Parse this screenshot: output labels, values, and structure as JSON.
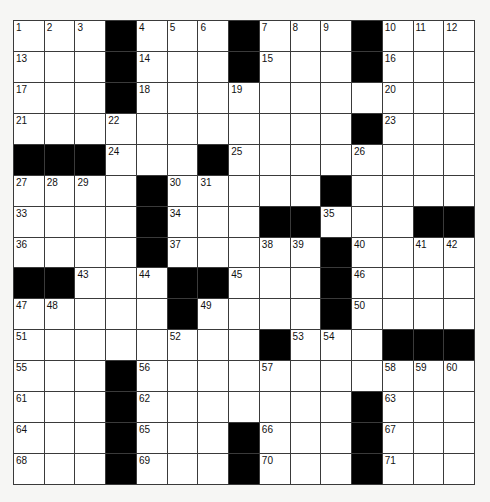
{
  "puzzle": {
    "rows": 15,
    "cols": 15,
    "grid": [
      "...#...#...#...",
      "...#...#...#...",
      "...#...........",
      "...........#...",
      "###...#........",
      "....#.....#....",
      "....#...##...##",
      "....#.....#....",
      "##...##...#....",
      ".....#....#....",
      "........#...###",
      "...#...........",
      "...#.......#...",
      "...#...#...#...",
      "...#...#...#..."
    ],
    "numbers": [
      [
        1,
        2,
        3,
        0,
        4,
        5,
        6,
        0,
        7,
        8,
        9,
        0,
        10,
        11,
        12
      ],
      [
        13,
        0,
        0,
        0,
        14,
        0,
        0,
        0,
        15,
        0,
        0,
        0,
        16,
        0,
        0
      ],
      [
        17,
        0,
        0,
        0,
        18,
        0,
        0,
        19,
        0,
        0,
        0,
        0,
        20,
        0,
        0
      ],
      [
        21,
        0,
        0,
        22,
        0,
        0,
        0,
        0,
        0,
        0,
        0,
        0,
        23,
        0,
        0
      ],
      [
        0,
        0,
        0,
        24,
        0,
        0,
        0,
        25,
        0,
        0,
        0,
        26,
        0,
        0,
        0
      ],
      [
        27,
        28,
        29,
        0,
        0,
        30,
        31,
        0,
        0,
        0,
        32,
        0,
        0,
        0,
        0
      ],
      [
        33,
        0,
        0,
        0,
        0,
        34,
        0,
        0,
        0,
        0,
        35,
        0,
        0,
        0,
        0
      ],
      [
        36,
        0,
        0,
        0,
        0,
        37,
        0,
        0,
        38,
        39,
        0,
        40,
        0,
        41,
        42
      ],
      [
        0,
        0,
        43,
        0,
        44,
        0,
        0,
        45,
        0,
        0,
        0,
        46,
        0,
        0,
        0
      ],
      [
        47,
        48,
        0,
        0,
        0,
        0,
        49,
        0,
        0,
        0,
        0,
        50,
        0,
        0,
        0
      ],
      [
        51,
        0,
        0,
        0,
        0,
        52,
        0,
        0,
        0,
        53,
        54,
        0,
        0,
        0,
        0
      ],
      [
        55,
        0,
        0,
        0,
        56,
        0,
        0,
        0,
        57,
        0,
        0,
        0,
        58,
        59,
        60
      ],
      [
        61,
        0,
        0,
        0,
        62,
        0,
        0,
        0,
        0,
        0,
        0,
        0,
        63,
        0,
        0
      ],
      [
        64,
        0,
        0,
        0,
        65,
        0,
        0,
        0,
        66,
        0,
        0,
        0,
        67,
        0,
        0
      ],
      [
        68,
        0,
        0,
        0,
        69,
        0,
        0,
        0,
        70,
        0,
        0,
        0,
        71,
        0,
        0
      ]
    ],
    "letters": [],
    "colors": {
      "block": "#000000",
      "cell": "#ffffff",
      "border": "#3a3a3a",
      "background": "#f6f6f4"
    }
  }
}
